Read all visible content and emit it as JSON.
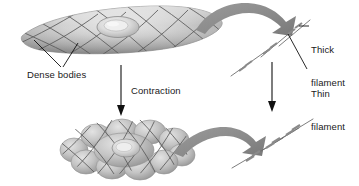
{
  "figure": {
    "background_color": "#ffffff",
    "text_color": "#1a1a1a",
    "width": 359,
    "height": 186
  },
  "labels": {
    "dense_bodies": "Dense bodies",
    "contraction": "Contraction",
    "thick_filament_line1": "Thick",
    "thick_filament_line2": "filament",
    "thin_filament_line1": "Thin",
    "thin_filament_line2": "filament"
  },
  "colors": {
    "arrow_gray": "#8c8c8c",
    "arrow_gray_dark": "#787878",
    "cell_fill_light": "#d9d9d9",
    "cell_fill_mid": "#bdbdbd",
    "cell_fill_dark": "#9e9e9e",
    "mesh_line": "#5a5a5a",
    "filament_line": "#6e6e6e",
    "thick_filament_mark": "#8a8a8a",
    "leader_line": "#111111"
  },
  "elements": {
    "relaxed_cell": {
      "name": "relaxed smooth muscle cell",
      "shape": "elongated spindle",
      "has_nucleus": true,
      "mesh": "diamond lattice of dense bodies"
    },
    "contracted_cell": {
      "name": "contracted smooth muscle cell",
      "shape": "shortened bulging globular mass",
      "has_nucleus": true,
      "mesh": "compressed diamond lattice"
    },
    "relaxed_filaments": {
      "name": "relaxed filament bundle",
      "thin_filament_count": 3,
      "thick_filament_count": 3,
      "orientation": "diagonal, lower-left to upper-right",
      "overlap": "minimal"
    },
    "contracted_filaments": {
      "name": "contracted filament bundle",
      "thin_filament_count": 3,
      "thick_filament_count": 3,
      "orientation": "diagonal, lower-left to upper-right",
      "overlap": "extensive sliding overlap"
    },
    "arrows": {
      "top_curved": "relaxed cell to relaxed filaments",
      "bottom_curved": "contracted cell to contracted filaments",
      "left_vertical": "contraction of whole cell",
      "right_vertical": "filament sliding during contraction"
    }
  }
}
